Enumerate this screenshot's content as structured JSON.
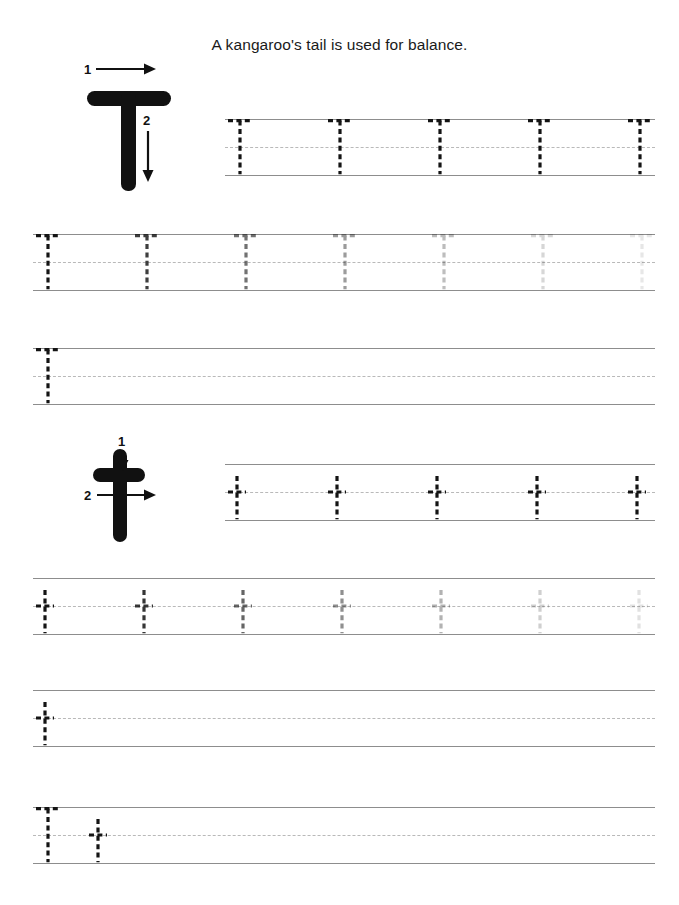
{
  "worksheet": {
    "sentence": "A kangaroo's tail is used for balance.",
    "letter_uppercase": "T",
    "letter_lowercase": "t",
    "ink_color": "#111111",
    "guide_solid_color": "#8d8d8d",
    "guide_dashed_color": "#b9b9b9",
    "trace_color": "#141414"
  },
  "models": [
    {
      "name": "uppercase-T-model",
      "letter": "T",
      "strokes": [
        {
          "number": "1",
          "direction": "right",
          "description": "horizontal top bar left to right"
        },
        {
          "number": "2",
          "direction": "down",
          "description": "vertical stem top to bottom"
        }
      ]
    },
    {
      "name": "lowercase-t-model",
      "letter": "t",
      "strokes": [
        {
          "number": "1",
          "direction": "down",
          "description": "vertical stem top to bottom"
        },
        {
          "number": "2",
          "direction": "right",
          "description": "horizontal crossbar left to right"
        }
      ]
    }
  ],
  "rows": [
    {
      "name": "uppercase-trace-row-1",
      "letter": "T",
      "indent": 225,
      "count": 5,
      "opacities": [
        1,
        1,
        1,
        1,
        1
      ]
    },
    {
      "name": "uppercase-fade-row-2",
      "letter": "T",
      "indent": 33,
      "count": 7,
      "opacities": [
        1,
        0.82,
        0.6,
        0.42,
        0.28,
        0.17,
        0.1
      ]
    },
    {
      "name": "uppercase-blank-row-3",
      "letter": "T",
      "indent": 33,
      "count": 1,
      "opacities": [
        1
      ]
    },
    {
      "name": "lowercase-trace-row-4",
      "letter": "t",
      "indent": 225,
      "count": 5,
      "opacities": [
        1,
        1,
        1,
        1,
        1
      ]
    },
    {
      "name": "lowercase-fade-row-5",
      "letter": "t",
      "indent": 33,
      "count": 8,
      "opacities": [
        1,
        0.85,
        0.65,
        0.47,
        0.32,
        0.2,
        0.12,
        0.07
      ]
    },
    {
      "name": "lowercase-blank-row-6",
      "letter": "t",
      "indent": 33,
      "count": 1,
      "opacities": [
        1
      ]
    },
    {
      "name": "mixed-pair-row-7",
      "letter": "Tt",
      "indent": 33,
      "count": 2,
      "opacities": [
        1,
        1
      ]
    }
  ]
}
